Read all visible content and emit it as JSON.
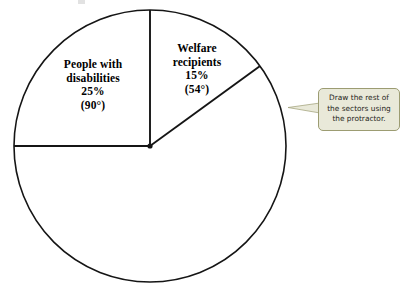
{
  "figure": {
    "type": "pie-chart-worksheet",
    "background_color": "#ffffff",
    "outline_color": "#1a1a1a"
  },
  "chart_data": {
    "type": "pie",
    "title": "",
    "subtitle": "",
    "xlabel": "",
    "ylabel": "",
    "legend_position": "none",
    "grid": false,
    "total_degrees": 360,
    "drawn_slices": 2,
    "categories": [
      "Welfare recipients",
      "People with disabilities"
    ],
    "values": [
      15,
      25
    ],
    "degrees": [
      54,
      90
    ],
    "start_angle_deg": 0,
    "direction": "clockwise-from-12-oclock-for-welfare, counterclockwise-from-12-oclock-for-disabilities",
    "annotations": [
      "Draw the rest of the sectors using the protractor."
    ],
    "slices": [
      {
        "name": "Welfare recipients",
        "label_line1": "Welfare",
        "label_line2": "recipients",
        "percent_text": "15%",
        "degrees_text": "(54°)",
        "percent_value": 15,
        "degrees_value": 54,
        "drawn": true
      },
      {
        "name": "People with disabilities",
        "label_line1": "People with",
        "label_line2": "disabilities",
        "percent_text": "25%",
        "degrees_text": "(90°)",
        "percent_value": 25,
        "degrees_value": 90,
        "drawn": true
      }
    ],
    "undrawn_remainder": {
      "percent_value": 60,
      "degrees_value": 216,
      "drawn": false
    }
  },
  "pie": {
    "center_x": 150,
    "center_y": 146,
    "radius": 136,
    "stroke_color": "#151515",
    "fill_color": "#ffffff",
    "radii_lines": [
      {
        "name": "vertical-up",
        "angle_from_12_deg": 0
      },
      {
        "name": "welfare-boundary",
        "angle_from_12_deg": 54
      },
      {
        "name": "disabilities-boundary",
        "angle_from_12_deg": -90
      }
    ]
  },
  "labels": {
    "disabilities": {
      "line1": "People with",
      "line2": "disabilities",
      "percent": "25%",
      "degrees": "(90°)"
    },
    "welfare": {
      "line1": "Welfare",
      "line2": "recipients",
      "percent": "15%",
      "degrees": "(54°)"
    }
  },
  "callout": {
    "line1": "Draw the rest of",
    "line2": "the sectors using",
    "line3": "the protractor.",
    "background_color": "#e9e9d9",
    "border_color": "#9c9c72",
    "text_color": "#26261a"
  }
}
